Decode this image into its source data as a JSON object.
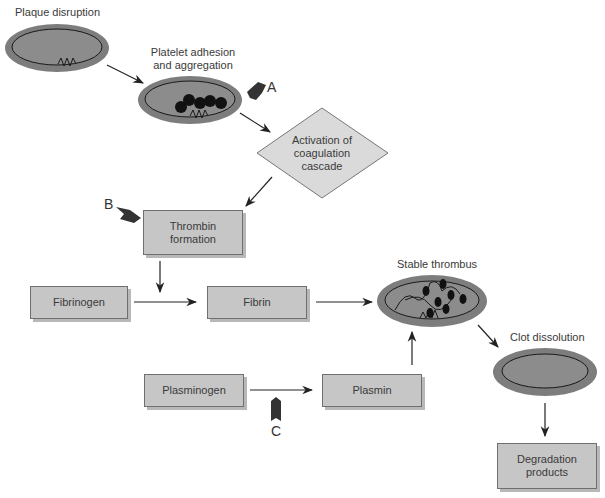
{
  "colors": {
    "ellipse_fill": "#7d7d7d",
    "ellipse_inner": "#8f8f8f",
    "box_fill": "#c6c6c6",
    "diamond_fill": "#dadada",
    "arrow": "#222222",
    "marker": "#333333"
  },
  "nodes": {
    "plaque": {
      "label": "Plaque disruption",
      "shape": "ellipse"
    },
    "platelet": {
      "label_line1": "Platelet adhesion",
      "label_line2": "and aggregation",
      "shape": "ellipse"
    },
    "coagulation": {
      "line1": "Activation of",
      "line2": "coagulation",
      "line3": "cascade",
      "shape": "diamond"
    },
    "thrombin": {
      "line1": "Thrombin",
      "line2": "formation",
      "shape": "box"
    },
    "fibrinogen": {
      "label": "Fibrinogen",
      "shape": "box"
    },
    "fibrin": {
      "label": "Fibrin",
      "shape": "box"
    },
    "stable_thrombus": {
      "label": "Stable thrombus",
      "shape": "ellipse"
    },
    "plasminogen": {
      "label": "Plasminogen",
      "shape": "box"
    },
    "plasmin": {
      "label": "Plasmin",
      "shape": "box"
    },
    "clot_dissolution": {
      "label": "Clot dissolution",
      "shape": "ellipse"
    },
    "degradation": {
      "line1": "Degradation",
      "line2": "products",
      "shape": "box"
    }
  },
  "markers": {
    "a": "A",
    "b": "B",
    "c": "C"
  },
  "edges": [
    [
      "plaque",
      "platelet"
    ],
    [
      "platelet",
      "coagulation"
    ],
    [
      "coagulation",
      "thrombin"
    ],
    [
      "thrombin",
      "fibrinogen-fibrin-arrow"
    ],
    [
      "fibrinogen",
      "fibrin"
    ],
    [
      "fibrin",
      "stable_thrombus"
    ],
    [
      "plasminogen",
      "plasmin"
    ],
    [
      "plasmin",
      "stable_thrombus"
    ],
    [
      "stable_thrombus",
      "clot_dissolution"
    ],
    [
      "clot_dissolution",
      "degradation"
    ]
  ]
}
